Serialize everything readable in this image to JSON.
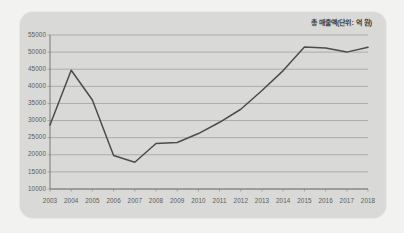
{
  "card": {
    "background_color": "#d9d9d7",
    "page_background_color": "#f2f2f0"
  },
  "legend": {
    "label": "총 매출액(단위: 억 원)",
    "position": "top-right"
  },
  "chart_data": {
    "type": "line",
    "title": "",
    "subtitle": "",
    "xlabel": "",
    "ylabel": "",
    "legend_position": "top-right",
    "grid": true,
    "categories": [
      "2003",
      "2004",
      "2005",
      "2006",
      "2007",
      "2008",
      "2009",
      "2010",
      "2011",
      "2012",
      "2013",
      "2014",
      "2015",
      "2016",
      "2017",
      "2018"
    ],
    "x": [
      "2003",
      "2004",
      "2005",
      "2006",
      "2007",
      "2008",
      "2009",
      "2010",
      "2011",
      "2012",
      "2013",
      "2014",
      "2015",
      "2016",
      "2017",
      "2018"
    ],
    "series": [
      {
        "name": "총 매출액(단위: 억 원)",
        "color": "#4c4c4a",
        "values": [
          28700,
          44700,
          36000,
          19800,
          17800,
          23300,
          23600,
          26200,
          29500,
          33300,
          38800,
          44600,
          51500,
          51200,
          50000,
          51400
        ]
      }
    ],
    "values": [
      28700,
      44700,
      36000,
      19800,
      17800,
      23300,
      23600,
      26200,
      29500,
      33300,
      38800,
      44600,
      51500,
      51200,
      50000,
      51400
    ],
    "ylim": [
      10000,
      55000
    ],
    "ytick_step": 5000,
    "yticks": [
      55000,
      50000,
      45000,
      40000,
      35000,
      30000,
      25000,
      20000,
      15000,
      10000
    ],
    "ytick_labels": [
      "55000",
      "50000",
      "45000",
      "40000",
      "35000",
      "30000",
      "25000",
      "20000",
      "15000",
      "10000"
    ],
    "xtick_labels": [
      "2003",
      "2004",
      "2005",
      "2006",
      "2007",
      "2008",
      "2009",
      "2010",
      "2011",
      "2012",
      "2013",
      "2014",
      "2015",
      "2016",
      "2017",
      "2018"
    ]
  }
}
